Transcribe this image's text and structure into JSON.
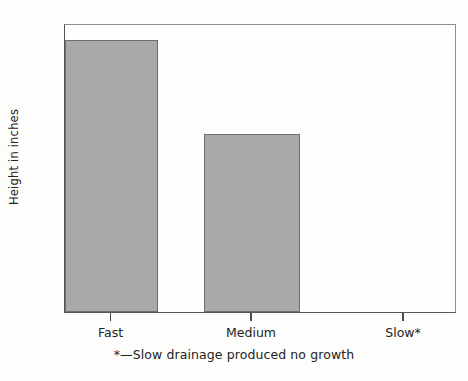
{
  "chart_data": {
    "type": "bar",
    "title": "",
    "xlabel": "",
    "ylabel": "Height in inches",
    "categories": [
      "Fast",
      "Medium",
      "Slow*"
    ],
    "values": [
      2.26,
      1.48,
      0
    ],
    "ylim": [
      0,
      2.4
    ],
    "ytick_labels": [
      "0",
      "0.2",
      "0.4",
      "0.6",
      "0.8",
      "1",
      "1.2",
      "1.4",
      "1.6",
      "1.8",
      "2",
      "2.2",
      "2.4"
    ],
    "ytick_values": [
      0,
      0.2,
      0.4,
      0.6,
      0.8,
      1,
      1.2,
      1.4,
      1.6,
      1.8,
      2,
      2.2,
      2.4
    ],
    "grid": false,
    "legend": null,
    "annotations": [
      "*—Slow drainage produced no growth"
    ],
    "bar_color": "#a9a9a9",
    "bar_edge_color": "#6f6f6f",
    "axis_color": "#4a4a4a",
    "background": "#fdfdfb"
  },
  "footnote": "*—Slow drainage produced no growth"
}
